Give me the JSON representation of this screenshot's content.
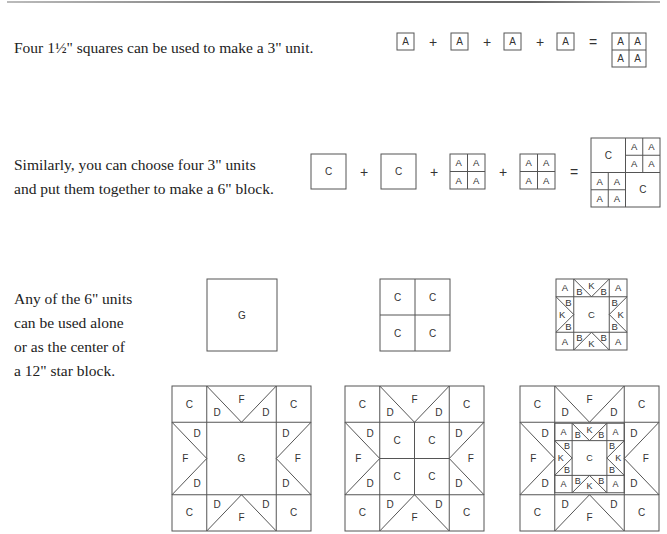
{
  "sections": [
    {
      "id": "row1",
      "text_lines": [
        "Four 1½\" squares can be used to make a 3\" unit."
      ],
      "equation": {
        "terms": [
          "A",
          "A",
          "A",
          "A"
        ],
        "operator": "+",
        "equals": "=",
        "result_grid": [
          [
            "A",
            "A"
          ],
          [
            "A",
            "A"
          ]
        ]
      }
    },
    {
      "id": "row2",
      "text_lines": [
        "Similarly, you can choose four 3\" units",
        "and put them together to make a 6\" block."
      ],
      "equation": {
        "terms": [
          "C",
          "C",
          "AAAA",
          "AAAA"
        ],
        "operator": "+",
        "equals": "=",
        "result_quadrants": [
          "C",
          "AAAA",
          "AAAA",
          "C"
        ]
      }
    },
    {
      "id": "row3",
      "text_lines": [
        "Any of the 6\" units",
        "can be used alone",
        "or as the center of",
        "a 12\" star block."
      ],
      "units": [
        "G",
        "C C / C C",
        "Star: A B K B A / B K C K B / A B K B A"
      ]
    },
    {
      "id": "row4",
      "star_blocks": [
        {
          "center": "G",
          "corners": "C",
          "points": "F",
          "point_sides": "D"
        },
        {
          "center": "C C / C C",
          "corners": "C",
          "points": "F",
          "point_sides": "D"
        },
        {
          "center": "mini star (A, B, K, C)",
          "corners": "C",
          "points": "F",
          "point_sides": "D"
        }
      ]
    }
  ],
  "labels": {
    "A": "A",
    "B": "B",
    "C": "C",
    "D": "D",
    "F": "F",
    "G": "G",
    "K": "K",
    "plus": "+",
    "equals": "="
  },
  "colors": {
    "line": "#555555",
    "text": "#222222",
    "label": "#333333"
  }
}
